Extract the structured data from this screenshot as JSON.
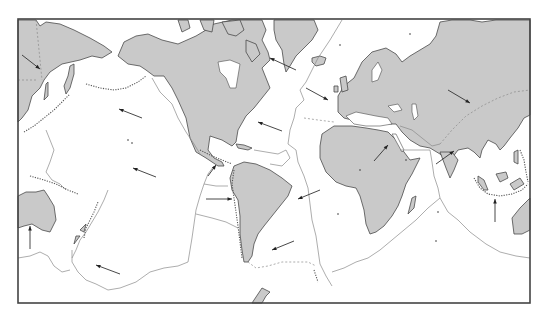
{
  "map": {
    "title": "",
    "type": "world plate tectonics map",
    "projection": "Pacific-centered",
    "frame": {
      "x": 18,
      "y": 19,
      "width": 512,
      "height": 284
    },
    "colors": {
      "land": "#c9c9c9",
      "ocean": "#ffffff",
      "coastline": "#4a4a4a",
      "plate_boundary": "#8a8a8a",
      "arrow": "#333333",
      "frame": "#444444"
    },
    "legend": [],
    "landmasses": [
      "East Asia / Siberia",
      "Japan",
      "North America",
      "Greenland",
      "Iceland",
      "Europe / Asia",
      "Africa",
      "Madagascar",
      "Arabia",
      "India",
      "Southeast Asia islands",
      "Australia",
      "New Zealand",
      "South America",
      "Antarctic Peninsula"
    ],
    "motion_arrows": [
      {
        "id": "eurasia-west",
        "x1": 22,
        "y1": 55,
        "x2": 40,
        "y2": 69
      },
      {
        "id": "pacific-nw-1",
        "x1": 142,
        "y1": 118,
        "x2": 119,
        "y2": 109
      },
      {
        "id": "pacific-nw-2",
        "x1": 156,
        "y1": 177,
        "x2": 133,
        "y2": 168
      },
      {
        "id": "pacific-nw-3",
        "x1": 120,
        "y1": 274,
        "x2": 96,
        "y2": 265
      },
      {
        "id": "nazca-east",
        "x1": 206,
        "y1": 199,
        "x2": 232,
        "y2": 199
      },
      {
        "id": "cocos-ne",
        "x1": 208,
        "y1": 176,
        "x2": 216,
        "y2": 165
      },
      {
        "id": "caribbean-w",
        "x1": 282,
        "y1": 131,
        "x2": 258,
        "y2": 122
      },
      {
        "id": "n-america-w",
        "x1": 296,
        "y1": 70,
        "x2": 270,
        "y2": 58
      },
      {
        "id": "atlantic-e",
        "x1": 306,
        "y1": 88,
        "x2": 328,
        "y2": 100
      },
      {
        "id": "s-america-w-1",
        "x1": 320,
        "y1": 190,
        "x2": 298,
        "y2": 199
      },
      {
        "id": "s-america-w-2",
        "x1": 294,
        "y1": 241,
        "x2": 272,
        "y2": 250
      },
      {
        "id": "eurasia-se",
        "x1": 448,
        "y1": 90,
        "x2": 470,
        "y2": 103
      },
      {
        "id": "africa-ne",
        "x1": 374,
        "y1": 161,
        "x2": 388,
        "y2": 145
      },
      {
        "id": "india-ne",
        "x1": 436,
        "y1": 164,
        "x2": 454,
        "y2": 151
      },
      {
        "id": "australia-n-1",
        "x1": 495,
        "y1": 222,
        "x2": 495,
        "y2": 199
      },
      {
        "id": "australia-n-2",
        "x1": 30,
        "y1": 249,
        "x2": 30,
        "y2": 226
      }
    ]
  }
}
